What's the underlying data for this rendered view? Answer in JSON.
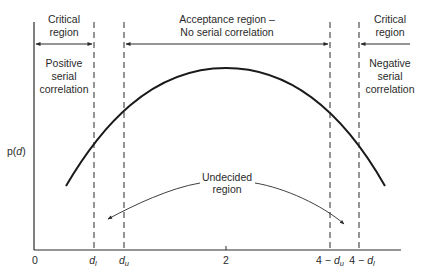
{
  "diagram": {
    "type": "durbin-watson-decision-regions",
    "y_axis_label": "p(d)",
    "y_axis_label_parts": {
      "prefix": "p(",
      "var": "d",
      "suffix": ")"
    },
    "x_ticks": [
      {
        "id": "zero",
        "label": "0"
      },
      {
        "id": "dl",
        "label_main": "d",
        "label_sub": "l"
      },
      {
        "id": "du",
        "label_main": "d",
        "label_sub": "u"
      },
      {
        "id": "two",
        "label": "2"
      },
      {
        "id": "four_minus_du",
        "label_prefix": "4 − ",
        "label_main": "d",
        "label_sub": "u"
      },
      {
        "id": "four_minus_dl",
        "label_prefix": "4 − ",
        "label_main": "d",
        "label_sub": "l"
      }
    ],
    "regions": {
      "left_critical": {
        "title_line1": "Critical",
        "title_line2": "region",
        "desc_line1": "Positive",
        "desc_line2": "serial",
        "desc_line3": "correlation"
      },
      "acceptance": {
        "title_line1": "Acceptance region –",
        "title_line2": "No serial correlation"
      },
      "right_critical": {
        "title_line1": "Critical",
        "title_line2": "region",
        "desc_line1": "Negative",
        "desc_line2": "serial",
        "desc_line3": "correlation"
      },
      "undecided": {
        "line1": "Undecided",
        "line2": "region"
      }
    },
    "colors": {
      "ink": "#2a2a2a",
      "background": "#ffffff"
    }
  }
}
